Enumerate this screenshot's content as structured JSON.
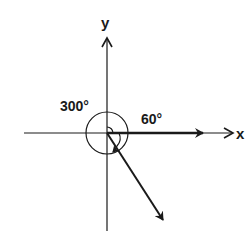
{
  "diagram": {
    "type": "angle-diagram",
    "axes": {
      "x_label": "x",
      "y_label": "y"
    },
    "angles": {
      "large_label": "300°",
      "small_label": "60°"
    },
    "vectors": [
      {
        "name": "initial-side",
        "direction_deg": 0
      },
      {
        "name": "terminal-side",
        "direction_deg": 300
      }
    ],
    "colors": {
      "stroke": "#1a1a1a",
      "background": "#ffffff"
    }
  }
}
